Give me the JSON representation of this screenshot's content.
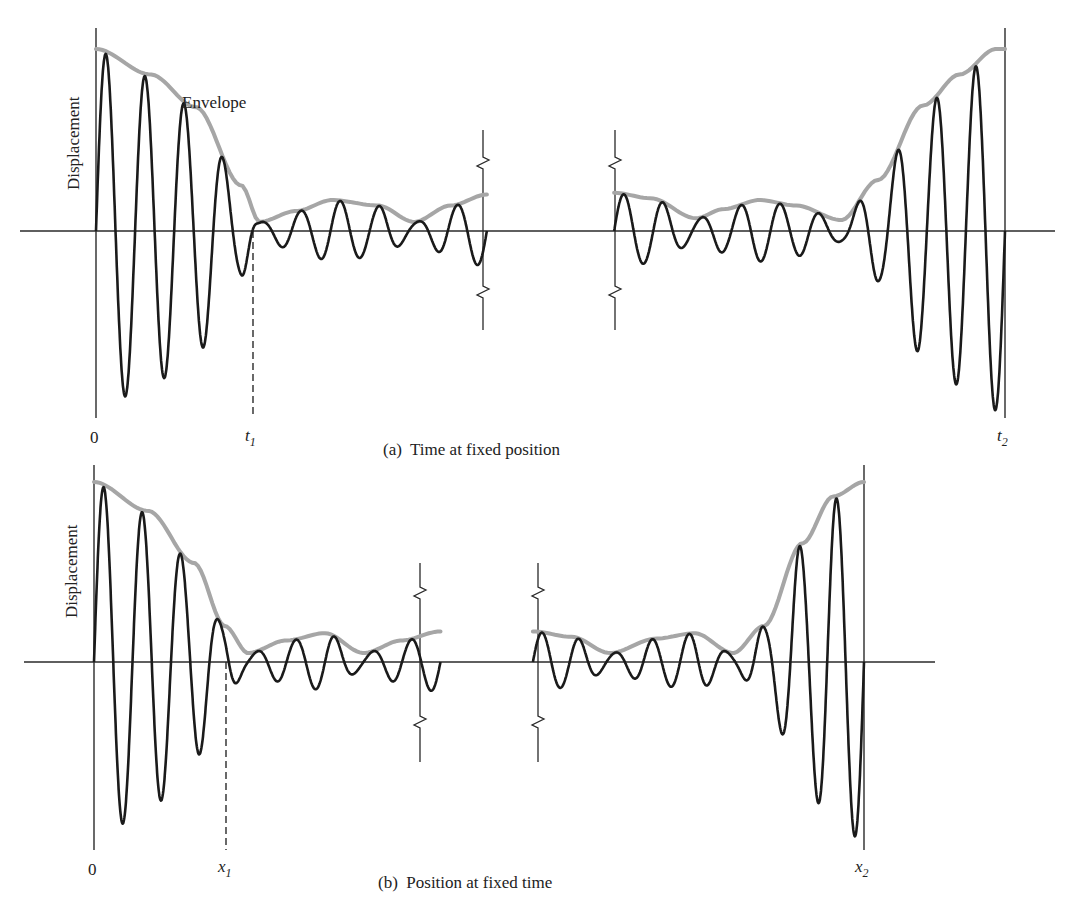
{
  "figure": {
    "panels": [
      {
        "id": "a",
        "caption": "(a)  Time at fixed position",
        "ylabel": "Displacement",
        "annotation": "Envelope",
        "origin_label": "0",
        "marker1": {
          "var": "t",
          "sub": "1"
        },
        "marker2": {
          "var": "t",
          "sub": "2"
        }
      },
      {
        "id": "b",
        "caption": "(b)  Position at fixed time",
        "ylabel": "Displacement",
        "annotation": "",
        "origin_label": "0",
        "marker1": {
          "var": "x",
          "sub": "1"
        },
        "marker2": {
          "var": "x",
          "sub": "2"
        }
      }
    ],
    "colors": {
      "wave": "#1a1a1a",
      "envelope": "#a6a6a6",
      "axis": "#2a2a2a"
    }
  },
  "chart_data": [
    {
      "type": "line",
      "title": "(a) Time at fixed position",
      "xlabel": "time",
      "ylabel": "Displacement",
      "tick_labels": [
        "0",
        "t1",
        "t2"
      ],
      "axis_break": "between the two oscillation segments",
      "series": [
        {
          "name": "Displacement (oscillation)",
          "description": "carrier oscillation bounded by envelope"
        },
        {
          "name": "Envelope",
          "left_segment": {
            "x": [
              0,
              0.06,
              0.11,
              0.16,
              0.18,
              0.22,
              0.26,
              0.31,
              0.35,
              0.39,
              0.43
            ],
            "y": [
              1.0,
              0.86,
              0.68,
              0.25,
              0.05,
              0.11,
              0.17,
              0.14,
              0.05,
              0.14,
              0.2
            ]
          },
          "right_segment": {
            "x": [
              0.57,
              0.61,
              0.66,
              0.69,
              0.73,
              0.77,
              0.82,
              0.86,
              0.91,
              0.95,
              0.99,
              1.0
            ],
            "y": [
              0.21,
              0.18,
              0.07,
              0.12,
              0.17,
              0.14,
              0.06,
              0.28,
              0.69,
              0.86,
              1.0,
              1.0
            ]
          }
        }
      ],
      "markers": {
        "t1": 0.18,
        "t2": 1.0
      }
    },
    {
      "type": "line",
      "title": "(b) Position at fixed time",
      "xlabel": "position",
      "ylabel": "Displacement",
      "tick_labels": [
        "0",
        "x1",
        "x2"
      ],
      "axis_break": "between the two oscillation segments",
      "series": [
        {
          "name": "Displacement (oscillation)",
          "description": "carrier oscillation bounded by envelope"
        },
        {
          "name": "Envelope",
          "left_segment": {
            "x": [
              0,
              0.07,
              0.13,
              0.17,
              0.2,
              0.25,
              0.3,
              0.35,
              0.4,
              0.45
            ],
            "y": [
              1.0,
              0.84,
              0.55,
              0.2,
              0.05,
              0.12,
              0.16,
              0.05,
              0.12,
              0.17
            ]
          },
          "right_segment": {
            "x": [
              0.57,
              0.62,
              0.67,
              0.73,
              0.78,
              0.83,
              0.87,
              0.92,
              0.96,
              1.0
            ],
            "y": [
              0.17,
              0.14,
              0.05,
              0.13,
              0.16,
              0.05,
              0.2,
              0.66,
              0.92,
              1.0
            ]
          }
        }
      ],
      "markers": {
        "x1": 0.2,
        "x2": 1.0
      }
    }
  ]
}
